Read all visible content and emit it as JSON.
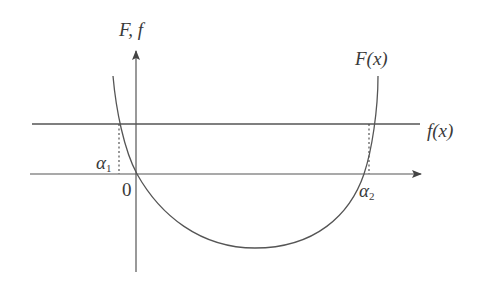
{
  "diagram": {
    "type": "function-graph",
    "labels": {
      "y_axis": "F, f",
      "curve_F": "F(x)",
      "line_f": "f(x)",
      "origin": "0",
      "alpha1_base": "α",
      "alpha1_sub": "1",
      "alpha2_base": "α",
      "alpha2_sub": "2"
    },
    "colors": {
      "stroke": "#555555",
      "text": "#3a3a3a",
      "background": "#ffffff"
    },
    "elements": {
      "x_axis": {
        "from": [
          30,
          174
        ],
        "to": [
          422,
          174
        ],
        "arrow": true
      },
      "y_axis": {
        "from": [
          136,
          272
        ],
        "to": [
          136,
          50
        ],
        "arrow": true
      },
      "horizontal_line_f": {
        "from": [
          32,
          124
        ],
        "to": [
          420,
          124
        ]
      },
      "curve_F": "U-shaped convex curve crossing the x-axis at origin and at alpha2, minimum near x=255",
      "dashed_alpha1": {
        "x": 119,
        "from_y": 124,
        "to_y": 174
      },
      "dashed_alpha2": {
        "x": 369,
        "from_y": 124,
        "to_y": 174
      }
    }
  }
}
